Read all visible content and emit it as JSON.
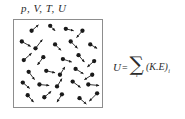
{
  "figure": {
    "background_color": "#ffffff",
    "ink_color": "#1a1a1a",
    "box_border_color": "#8d8d8d"
  },
  "state_variables": {
    "label": "p, V, T, U",
    "symbols": [
      "p",
      "V",
      "T",
      "U"
    ]
  },
  "container": {
    "name": "gas-container-box",
    "x": 13,
    "y": 19,
    "width": 90,
    "height": 89
  },
  "equation": {
    "left_symbol": "U",
    "operator": "=",
    "sum_glyph": "∑",
    "sum_index": "i",
    "term": "(K.E)",
    "term_index": "i",
    "plain_text": "U = ∑ᵢ (K.E)ᵢ"
  },
  "chart_data": {
    "type": "scatter",
    "title": "p, V, T, U",
    "xlabel": "",
    "ylabel": "",
    "xlim": [
      0,
      90
    ],
    "ylim": [
      0,
      89
    ],
    "grid": false,
    "legend": "none",
    "particles": [
      {
        "x": 18,
        "y": 11,
        "vx": 7,
        "vy": -6
      },
      {
        "x": 37,
        "y": 6,
        "vx": 5,
        "vy": 5
      },
      {
        "x": 53,
        "y": 9,
        "vx": 8,
        "vy": 2
      },
      {
        "x": 70,
        "y": 11,
        "vx": -6,
        "vy": 7
      },
      {
        "x": 8,
        "y": 22,
        "vx": 9,
        "vy": 5
      },
      {
        "x": 22,
        "y": 29,
        "vx": 7,
        "vy": -9
      },
      {
        "x": 42,
        "y": 25,
        "vx": 6,
        "vy": 6
      },
      {
        "x": 58,
        "y": 22,
        "vx": 7,
        "vy": 7
      },
      {
        "x": 78,
        "y": 25,
        "vx": 7,
        "vy": 4
      },
      {
        "x": 10,
        "y": 41,
        "vx": 8,
        "vy": -7
      },
      {
        "x": 30,
        "y": 38,
        "vx": -6,
        "vy": 8
      },
      {
        "x": 50,
        "y": 40,
        "vx": 9,
        "vy": 3
      },
      {
        "x": 66,
        "y": 36,
        "vx": 6,
        "vy": 7
      },
      {
        "x": 82,
        "y": 42,
        "vx": -7,
        "vy": 6
      },
      {
        "x": 15,
        "y": 53,
        "vx": 6,
        "vy": 8
      },
      {
        "x": 33,
        "y": 52,
        "vx": 9,
        "vy": 2
      },
      {
        "x": 47,
        "y": 56,
        "vx": 5,
        "vy": -8
      },
      {
        "x": 63,
        "y": 50,
        "vx": 8,
        "vy": 5
      },
      {
        "x": 80,
        "y": 56,
        "vx": -8,
        "vy": 5
      },
      {
        "x": 9,
        "y": 64,
        "vx": 7,
        "vy": 6
      },
      {
        "x": 26,
        "y": 66,
        "vx": 10,
        "vy": 1
      },
      {
        "x": 44,
        "y": 68,
        "vx": 5,
        "vy": -8
      },
      {
        "x": 60,
        "y": 63,
        "vx": 8,
        "vy": 6
      },
      {
        "x": 76,
        "y": 66,
        "vx": 11,
        "vy": 1
      },
      {
        "x": 14,
        "y": 77,
        "vx": 6,
        "vy": 7
      },
      {
        "x": 31,
        "y": 79,
        "vx": 7,
        "vy": -6
      },
      {
        "x": 49,
        "y": 76,
        "vx": -5,
        "vy": 8
      },
      {
        "x": 67,
        "y": 80,
        "vx": 7,
        "vy": 6
      },
      {
        "x": 85,
        "y": 75,
        "vx": -8,
        "vy": 8
      }
    ],
    "particle_count": 29,
    "dot_radius": 2.2,
    "arrow_color": "#1a1a1a"
  }
}
